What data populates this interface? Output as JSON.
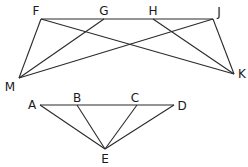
{
  "figures": [
    {
      "id": "top-figure",
      "points": {
        "F": {
          "x": 41,
          "y": 19,
          "lx": 36,
          "ly": 11
        },
        "G": {
          "x": 104,
          "y": 19,
          "lx": 104,
          "ly": 11
        },
        "H": {
          "x": 153,
          "y": 19,
          "lx": 153,
          "ly": 11
        },
        "J": {
          "x": 213,
          "y": 19,
          "lx": 219,
          "ly": 12
        },
        "M": {
          "x": 19,
          "y": 78,
          "lx": 10,
          "ly": 87
        },
        "K": {
          "x": 234,
          "y": 74,
          "lx": 242,
          "ly": 74
        }
      },
      "edges": [
        [
          "F",
          "J"
        ],
        [
          "F",
          "M"
        ],
        [
          "F",
          "K"
        ],
        [
          "G",
          "M"
        ],
        [
          "H",
          "K"
        ],
        [
          "J",
          "M"
        ],
        [
          "J",
          "K"
        ]
      ]
    },
    {
      "id": "bottom-figure",
      "points": {
        "A": {
          "x": 40,
          "y": 105,
          "lx": 32,
          "ly": 105
        },
        "B": {
          "x": 77,
          "y": 105,
          "lx": 77,
          "ly": 98
        },
        "C": {
          "x": 137,
          "y": 105,
          "lx": 135,
          "ly": 98
        },
        "D": {
          "x": 174,
          "y": 105,
          "lx": 182,
          "ly": 106
        },
        "E": {
          "x": 105,
          "y": 149,
          "lx": 105,
          "ly": 159
        }
      },
      "edges": [
        [
          "A",
          "D"
        ],
        [
          "A",
          "E"
        ],
        [
          "B",
          "E"
        ],
        [
          "C",
          "E"
        ],
        [
          "D",
          "E"
        ]
      ]
    }
  ],
  "labels": {
    "F": "F",
    "G": "G",
    "H": "H",
    "J": "J",
    "M": "M",
    "K": "K",
    "A": "A",
    "B": "B",
    "C": "C",
    "D": "D",
    "E": "E"
  }
}
